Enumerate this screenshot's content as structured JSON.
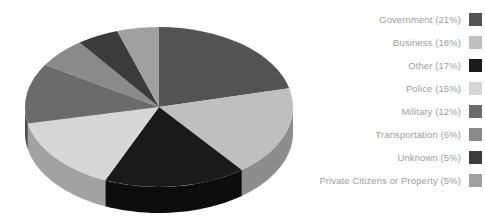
{
  "chart_data": {
    "type": "pie",
    "title": "",
    "subtitle": "",
    "xlabel": "",
    "ylabel": "",
    "legend_position": "right",
    "grid": false,
    "three_d": true,
    "categories": [
      "Government",
      "Business",
      "Other",
      "Police",
      "Military",
      "Transportation",
      "Unknown",
      "Private Citizens or Property"
    ],
    "values": [
      21,
      18,
      17,
      15,
      12,
      6,
      5,
      5
    ],
    "units": "percent",
    "slice_colors": [
      "#545454",
      "#bfbfbf",
      "#1a1a1a",
      "#d6d6d6",
      "#6b6b6b",
      "#8a8a8a",
      "#3b3b3b",
      "#a0a0a0"
    ],
    "side_colors": [
      "#3c3c3c",
      "#8d8d8d",
      "#0d0d0d",
      "#a2a2a2",
      "#4e4e4e",
      "#666666",
      "#2a2a2a",
      "#767676"
    ],
    "labels": [
      "Government (21%)",
      "Business (18%)",
      "Other (17%)",
      "Police (15%)",
      "Military (12%)",
      "Transportation (6%)",
      "Unknown (5%)",
      "Private Citizens or Property (5%)"
    ]
  },
  "legend": {
    "items": [
      {
        "label": "Government (21%)",
        "color": "#545454",
        "value": 21,
        "name": "Government"
      },
      {
        "label": "Business (18%)",
        "color": "#bfbfbf",
        "value": 18,
        "name": "Business"
      },
      {
        "label": "Other (17%)",
        "color": "#1a1a1a",
        "value": 17,
        "name": "Other"
      },
      {
        "label": "Police (15%)",
        "color": "#d6d6d6",
        "value": 15,
        "name": "Police"
      },
      {
        "label": "Military (12%)",
        "color": "#6b6b6b",
        "value": 12,
        "name": "Military"
      },
      {
        "label": "Transportation (6%)",
        "color": "#8a8a8a",
        "value": 6,
        "name": "Transportation"
      },
      {
        "label": "Unknown (5%)",
        "color": "#3b3b3b",
        "value": 5,
        "name": "Unknown"
      },
      {
        "label": "Private Citizens or Property (5%)",
        "color": "#a0a0a0",
        "value": 5,
        "name": "Private Citizens or Property"
      }
    ]
  },
  "style": {
    "background": "#ffffff",
    "text_color": "#9d9d9d"
  }
}
